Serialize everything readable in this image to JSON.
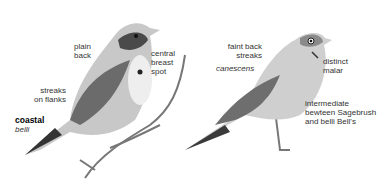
{
  "left_bird": {
    "labels": {
      "plain_back": [
        "plain",
        "back"
      ],
      "central_breast_spot": [
        "central",
        "breast",
        "spot"
      ],
      "streaks_on_flanks": [
        "streaks",
        "on flanks"
      ],
      "subspecies_bold": "coastal",
      "subspecies_italic": "belli"
    }
  },
  "right_bird": {
    "labels": {
      "faint_back_streaks": [
        "faint back",
        "streaks"
      ],
      "subspecies": "canescens",
      "distinct_malar": [
        "distinct",
        "malar"
      ],
      "intermediate": [
        "intermediate",
        "bewteen Sagebrush",
        "and belli Bell's"
      ]
    }
  }
}
